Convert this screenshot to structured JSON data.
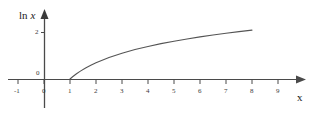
{
  "figure": {
    "background_color": "#ffffff",
    "axis_color": "#4a4a4a",
    "curve_color": "#555555",
    "label_color": "#2a2a2a",
    "y_axis_title_prefix": "ln",
    "y_axis_title_var": "x",
    "x_axis_title": "x"
  },
  "chart_data": {
    "type": "line",
    "title": "",
    "xlabel": "x",
    "ylabel": "ln x",
    "grid": false,
    "legend": "none",
    "xlim": [
      -1.25,
      9.9
    ],
    "ylim": [
      -0.85,
      2.55
    ],
    "x_ticks": [
      -1,
      0,
      1,
      2,
      3,
      4,
      5,
      6,
      7,
      8,
      9
    ],
    "x_tick_labels": [
      "-1",
      "0",
      "1",
      "2",
      "3",
      "4",
      "5",
      "6",
      "7",
      "8",
      "9"
    ],
    "y_ticks": [
      0,
      2
    ],
    "y_tick_labels": [
      "0",
      "2"
    ],
    "series": [
      {
        "name": "ln x",
        "x": [
          1.0,
          1.1,
          1.25,
          1.4,
          1.6,
          1.8,
          2.0,
          2.5,
          3.0,
          3.5,
          4.0,
          4.5,
          5.0,
          5.5,
          6.0,
          6.5,
          7.0,
          7.5,
          8.0
        ],
        "y": [
          0.0,
          0.095,
          0.223,
          0.336,
          0.47,
          0.588,
          0.693,
          0.916,
          1.099,
          1.253,
          1.386,
          1.504,
          1.609,
          1.705,
          1.792,
          1.872,
          1.946,
          2.015,
          2.079
        ]
      }
    ]
  },
  "ticks": {
    "x": [
      {
        "label": "-1",
        "px": 18
      },
      {
        "label": "0",
        "px": 44
      },
      {
        "label": "1",
        "px": 70
      },
      {
        "label": "2",
        "px": 96
      },
      {
        "label": "3",
        "px": 122
      },
      {
        "label": "4",
        "px": 148
      },
      {
        "label": "5",
        "px": 174
      },
      {
        "label": "6",
        "px": 200
      },
      {
        "label": "7",
        "px": 226
      },
      {
        "label": "8",
        "px": 252
      },
      {
        "label": "9",
        "px": 278
      }
    ],
    "y": [
      {
        "label": "0",
        "px": 79
      },
      {
        "label": "2",
        "px": 32
      }
    ]
  }
}
